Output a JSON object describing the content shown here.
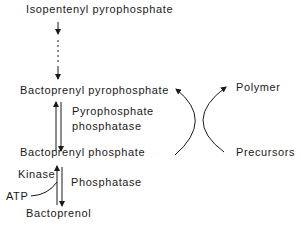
{
  "diagram": {
    "nodes": {
      "isopentenyl_pp": "Isopentenyl pyrophosphate",
      "bactoprenyl_pp": "Bactoprenyl pyrophosphate",
      "bactoprenyl_p": "Bactoprenyl phosphate",
      "bactoprenol": "Bactoprenol",
      "polymer": "Polymer",
      "precursors": "Precursors",
      "atp": "ATP"
    },
    "enzymes": {
      "pyrophosphate_phosphatase_line1": "Pyrophosphate",
      "pyrophosphate_phosphatase_line2": "phosphatase",
      "kinase": "Kinase",
      "phosphatase": "Phosphatase"
    },
    "edges": [
      {
        "from": "Isopentenyl pyrophosphate",
        "to": "Bactoprenyl pyrophosphate",
        "style": "dashed-multistep"
      },
      {
        "from": "Bactoprenyl pyrophosphate",
        "to": "Bactoprenyl phosphate",
        "label": "Pyrophosphate phosphatase",
        "style": "reversible"
      },
      {
        "from": "Bactoprenyl phosphate",
        "to": "Bactoprenol",
        "label": "Phosphatase"
      },
      {
        "from": "Bactoprenol",
        "to": "Bactoprenyl phosphate",
        "label": "Kinase",
        "cofactor": "ATP"
      },
      {
        "from": "Precursors",
        "to": "Bactoprenyl pyrophosphate",
        "style": "curved"
      },
      {
        "from": "Bactoprenyl phosphate",
        "to": "Polymer",
        "style": "curved"
      }
    ],
    "colors": {
      "ink": "#1a1a1a",
      "background": "#ffffff"
    }
  }
}
